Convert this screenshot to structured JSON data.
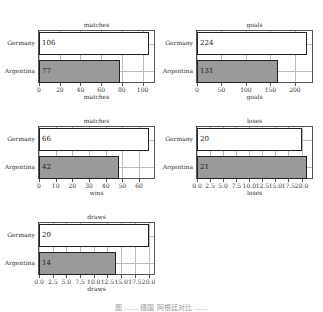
{
  "chart_data": [
    {
      "type": "bar",
      "orientation": "horizontal",
      "title": "matches",
      "categories": [
        "Germany",
        "Argentina"
      ],
      "values": [
        106,
        77
      ],
      "bar_lengths_estimated": [
        106,
        78
      ],
      "xlabel": "matches",
      "xticks": [
        "0",
        "20",
        "40",
        "60",
        "80",
        "100"
      ],
      "xlim": [
        0,
        111
      ]
    },
    {
      "type": "bar",
      "orientation": "horizontal",
      "title": "goals",
      "categories": [
        "Germany",
        "Argentina"
      ],
      "values": [
        224,
        131
      ],
      "bar_lengths_estimated": [
        224,
        165
      ],
      "xlabel": "goals",
      "xticks": [
        "0",
        "50",
        "100",
        "150",
        "200"
      ],
      "xlim": [
        0,
        235
      ]
    },
    {
      "type": "bar",
      "orientation": "horizontal",
      "title": "matches",
      "categories": [
        "Germany",
        "Argentina"
      ],
      "values": [
        66,
        42
      ],
      "bar_lengths_estimated": [
        66,
        48
      ],
      "xlabel": "wins",
      "xticks": [
        "0",
        "10",
        "20",
        "30",
        "40",
        "50",
        "60"
      ],
      "xlim": [
        0,
        69
      ]
    },
    {
      "type": "bar",
      "orientation": "horizontal",
      "title": "loses",
      "categories": [
        "Germany",
        "Argentina"
      ],
      "values": [
        20,
        21
      ],
      "bar_lengths_estimated": [
        20,
        21
      ],
      "xlabel": "loses",
      "xticks": [
        "0.0",
        "2.5",
        "5.0",
        "7.5",
        "10.0",
        "12.5",
        "15.0",
        "17.5",
        "20.0"
      ],
      "xlim": [
        0,
        22
      ]
    },
    {
      "type": "bar",
      "orientation": "horizontal",
      "title": "draws",
      "categories": [
        "Germany",
        "Argentina"
      ],
      "values": [
        20,
        14
      ],
      "bar_lengths_estimated": [
        20,
        14
      ],
      "xlabel": "draws",
      "xticks": [
        "0.0",
        "2.5",
        "5.0",
        "7.5",
        "10.0",
        "12.5",
        "15.0",
        "17.5",
        "20.0"
      ],
      "xlim": [
        0,
        21
      ]
    }
  ],
  "colors": {
    "germany_bar": "#ffffff",
    "argentina_bar": "#9a9a9a",
    "edge": "#222222"
  },
  "caption": "图 …… 德国 阿根廷对比 ……"
}
